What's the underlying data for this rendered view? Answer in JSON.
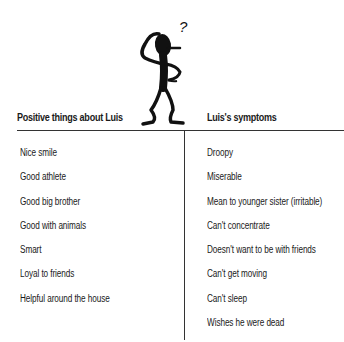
{
  "headings": {
    "left": "Positive things about Luis",
    "right": "Luis's symptoms"
  },
  "figure": {
    "icon": "confused-stick-figure-icon",
    "glyph": "?"
  },
  "positive_things": [
    "Nice smile",
    "Good athlete",
    "Good big brother",
    "Good with animals",
    "Smart",
    "Loyal to friends",
    "Helpful around the house"
  ],
  "symptoms": [
    "Droopy",
    "Miserable",
    "Mean to younger sister (irritable)",
    "Can't concentrate",
    "Doesn't want to be with friends",
    "Can't get moving",
    "Can't sleep",
    "Wishes he were dead"
  ],
  "colors": {
    "text": "#1a1a1a",
    "rule": "#333333",
    "background": "#ffffff"
  }
}
